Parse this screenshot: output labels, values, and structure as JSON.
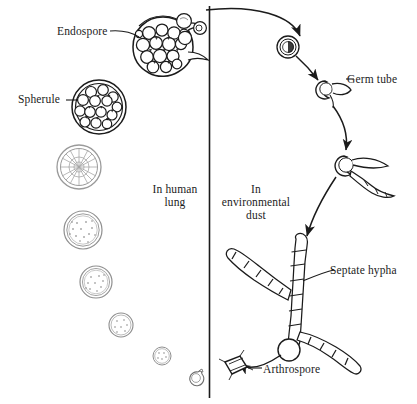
{
  "figure": {
    "ink_color": "#1b1b1b",
    "background_color": "#ffffff",
    "divider": {
      "name": "vertical-divider",
      "orientation": "vertical"
    }
  },
  "labels": {
    "endospore": "Endospore",
    "spherule": "Spherule",
    "in_human_lung": "In human\nlung",
    "in_environmental_dust": "In\nenvironmental\ndust",
    "germ_tube": "Germ tube",
    "septate_hypha": "Septate  hypha",
    "arthrospore": "Arthrospore"
  },
  "label_lines": {
    "in_human_lung_line1": "In human",
    "in_human_lung_line2": "lung",
    "in_environmental_dust_line1": "In",
    "in_environmental_dust_line2": "environmental",
    "in_environmental_dust_line3": "dust"
  },
  "structures": {
    "left_column": [
      {
        "name": "ruptured-spherule-releasing-endospores",
        "stage": 1,
        "cx": 163,
        "cy": 47,
        "r": 30,
        "description": "Mature spherule ruptured, endospores escaping"
      },
      {
        "name": "mature-spherule-packed-endospores",
        "stage": 2,
        "cx": 99,
        "cy": 107,
        "r": 27,
        "description": "Spherule filled with endospores"
      },
      {
        "name": "segmenting-spherule",
        "stage": 3,
        "cx": 79,
        "cy": 167,
        "r": 22,
        "description": "Spherule undergoing internal segmentation"
      },
      {
        "name": "enlarging-spherule",
        "stage": 4,
        "cx": 83,
        "cy": 230,
        "r": 19,
        "description": "Enlarging young spherule"
      },
      {
        "name": "young-spherule",
        "stage": 5,
        "cx": 96,
        "cy": 282,
        "r": 16,
        "description": "Young spherule"
      },
      {
        "name": "rounding-spore",
        "stage": 6,
        "cx": 121,
        "cy": 325,
        "r": 12,
        "description": "Rounding arthrospore"
      },
      {
        "name": "small-spore",
        "stage": 7,
        "cx": 162,
        "cy": 356,
        "r": 9,
        "description": "Small rounding spore"
      },
      {
        "name": "inhaled-arthrospore",
        "stage": 8,
        "cx": 196,
        "cy": 377,
        "r": 7,
        "description": "Arthrospore just inhaled, rounding up"
      }
    ],
    "right_column": [
      {
        "name": "released-endospore-right",
        "stage": 1,
        "cx": 288,
        "cy": 47,
        "r": 11,
        "description": "Endospore carried into environment"
      },
      {
        "name": "germ-tube-stage",
        "stage": 2,
        "cx": 325,
        "cy": 89,
        "r": 9,
        "description": "Spore producing a germ tube"
      },
      {
        "name": "branching-hypha-stage",
        "stage": 3,
        "cx": 345,
        "cy": 163,
        "r": 10,
        "description": "Germinating spore with branching hyphae"
      },
      {
        "name": "septate-hypha-mycelium",
        "stage": 4,
        "cx": 305,
        "cy": 300,
        "r": 0,
        "description": "Branched septate hyphal mycelium"
      },
      {
        "name": "arthrospore-fragment",
        "stage": 5,
        "cx": 236,
        "cy": 371,
        "r": 0,
        "description": "Detached barrel-shaped arthrospore"
      }
    ]
  },
  "arrows": [
    {
      "name": "arrow-spherule-rupture-to-environment",
      "from": "ruptured-spherule",
      "to": "released-endospore-right"
    },
    {
      "name": "arrow-endospore-to-germ-tube",
      "from": "released-endospore-right",
      "to": "germ-tube-stage"
    },
    {
      "name": "arrow-germ-tube-to-branching-hypha",
      "from": "germ-tube-stage",
      "to": "branching-hypha-stage"
    },
    {
      "name": "arrow-branching-hypha-to-septate-hypha",
      "from": "branching-hypha-stage",
      "to": "septate-hypha-mycelium"
    },
    {
      "name": "arrow-hypha-to-arthrospore",
      "from": "septate-hypha-mycelium",
      "to": "arthrospore-fragment"
    }
  ],
  "leader_lines": [
    {
      "name": "leader-endospore",
      "label": "endospore"
    },
    {
      "name": "leader-spherule",
      "label": "spherule"
    },
    {
      "name": "leader-germ-tube",
      "label": "germ_tube"
    },
    {
      "name": "leader-septate-hypha",
      "label": "septate_hypha"
    },
    {
      "name": "leader-arthrospore",
      "label": "arthrospore"
    }
  ]
}
